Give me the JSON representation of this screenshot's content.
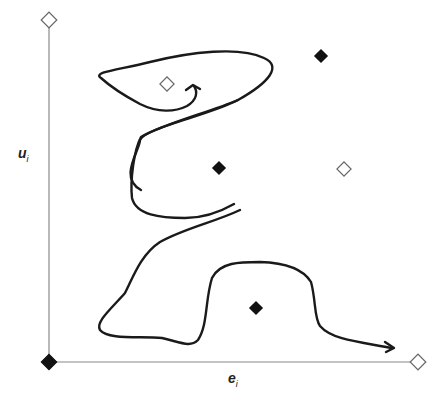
{
  "diagram": {
    "colors": {
      "axis": "#8a8a8a",
      "curve": "#1a1a1a",
      "filled_marker": "#111111",
      "open_marker_stroke": "#666666",
      "background": "#ffffff"
    },
    "axes": {
      "x_label_main": "e",
      "x_label_sub": "i",
      "y_label_main": "u",
      "y_label_sub": "i"
    },
    "markers": [
      {
        "id": "top-left-open",
        "type": "open",
        "x": 49,
        "y": 20
      },
      {
        "id": "origin-filled",
        "type": "filled",
        "x": 49,
        "y": 362
      },
      {
        "id": "right-end-open",
        "type": "open",
        "x": 418,
        "y": 362
      },
      {
        "id": "loop-center-open",
        "type": "open",
        "x": 167,
        "y": 84
      },
      {
        "id": "upper-right-filled",
        "type": "filled",
        "x": 321,
        "y": 56
      },
      {
        "id": "middle-filled",
        "type": "filled",
        "x": 219,
        "y": 168
      },
      {
        "id": "middle-right-open",
        "type": "open",
        "x": 344,
        "y": 169
      },
      {
        "id": "bottom-filled",
        "type": "filled",
        "x": 256,
        "y": 308
      }
    ],
    "curves": [
      {
        "id": "upper-loop-with-arrow",
        "has_arrow": true
      },
      {
        "id": "middle-c-curve",
        "has_arrow": false
      },
      {
        "id": "lower-path-with-arrow",
        "has_arrow": true
      }
    ]
  }
}
